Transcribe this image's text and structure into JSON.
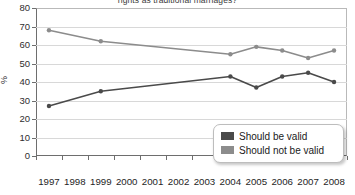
{
  "chart_data": {
    "type": "line",
    "title": "rights as traditional marriages?",
    "xlabel": "",
    "ylabel": "%",
    "ylim": [
      0,
      80
    ],
    "ytick_step": 10,
    "yticks": [
      0,
      10,
      20,
      30,
      40,
      50,
      60,
      70,
      80
    ],
    "grid": true,
    "legend_position": "bottom-right",
    "categories": [
      "1997",
      "1998",
      "1999",
      "2000",
      "2001",
      "2002",
      "2003",
      "2004",
      "2005",
      "2006",
      "2007",
      "2008"
    ],
    "series": [
      {
        "name": "Should be valid",
        "color": "#4a4a4a",
        "points": [
          {
            "x": "1997",
            "y": 27
          },
          {
            "x": "1999",
            "y": 35
          },
          {
            "x": "2004",
            "y": 43
          },
          {
            "x": "2005",
            "y": 37
          },
          {
            "x": "2006",
            "y": 43
          },
          {
            "x": "2007",
            "y": 45
          },
          {
            "x": "2008",
            "y": 40
          }
        ]
      },
      {
        "name": "Should not be valid",
        "color": "#8c8c8c",
        "points": [
          {
            "x": "1997",
            "y": 68
          },
          {
            "x": "1999",
            "y": 62
          },
          {
            "x": "2004",
            "y": 55
          },
          {
            "x": "2005",
            "y": 59
          },
          {
            "x": "2006",
            "y": 57
          },
          {
            "x": "2007",
            "y": 53
          },
          {
            "x": "2008",
            "y": 57
          }
        ]
      }
    ]
  },
  "legend": {
    "items": [
      {
        "label": "Should be valid",
        "color": "#4a4a4a"
      },
      {
        "label": "Should not be valid",
        "color": "#8c8c8c"
      }
    ]
  }
}
